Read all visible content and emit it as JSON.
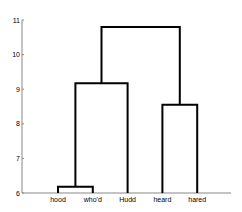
{
  "chart_data": {
    "type": "dendrogram",
    "title": "",
    "xlabel": "",
    "ylabel": "",
    "ylim": [
      6,
      11
    ],
    "yticks": [
      6,
      7,
      8,
      9,
      10,
      11
    ],
    "ytick_labels": [
      "6",
      "7",
      "8",
      "9",
      "10",
      "11"
    ],
    "grid": false,
    "leaves": [
      "hood",
      "who'd",
      "Hudd",
      "heard",
      "hared"
    ],
    "merges": [
      {
        "name": "hood-whod",
        "children": [
          "leaf:0",
          "leaf:1"
        ],
        "height": 6.18
      },
      {
        "name": "hood-whod-hudd",
        "children": [
          "node:0",
          "leaf:2"
        ],
        "height": 9.17
      },
      {
        "name": "heard-hared",
        "children": [
          "leaf:3",
          "leaf:4"
        ],
        "height": 8.55
      },
      {
        "name": "root",
        "children": [
          "node:1",
          "node:2"
        ],
        "height": 10.8
      }
    ],
    "colors": {
      "links": "#000000",
      "axis": "#888888"
    }
  }
}
